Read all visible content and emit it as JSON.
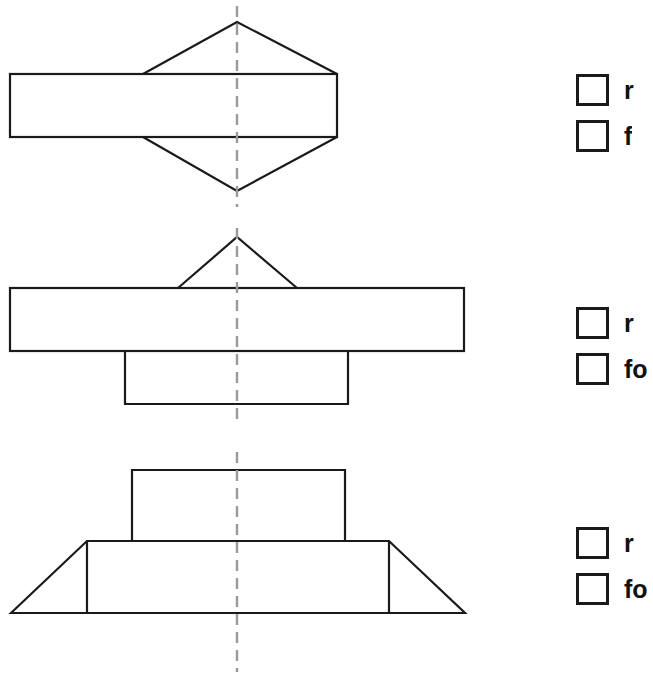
{
  "page": {
    "background_color": "#ffffff",
    "line_color": "#1a1a1a",
    "centerline_color": "#9a9a9a"
  },
  "figures": [
    {
      "id": "figure-1",
      "name": "hexagonal-prism-front-view",
      "description": "Horizontal rectangle with triangular peaks above and below meeting at the vertical centerline",
      "centerline_x": 237,
      "centerline_top": 6,
      "centerline_bottom": 207
    },
    {
      "id": "figure-2",
      "name": "stepped-block-with-roof-view",
      "description": "Wide horizontal rectangle with a small triangle on top and a narrower rectangle below",
      "centerline_x": 237,
      "centerline_top": 228,
      "centerline_bottom": 424
    },
    {
      "id": "figure-3",
      "name": "trapezoid-base-with-upper-block-view",
      "description": "Trapezoid base with internal vertical lines and an upper rectangle",
      "centerline_x": 237,
      "centerline_top": 452,
      "centerline_bottom": 672
    }
  ],
  "answer_groups": [
    {
      "name": "answer-group-1",
      "options": [
        {
          "name": "option-r",
          "label": "r",
          "checked": false
        },
        {
          "name": "option-f",
          "label": "f",
          "checked": false
        }
      ]
    },
    {
      "name": "answer-group-2",
      "options": [
        {
          "name": "option-r",
          "label": "r",
          "checked": false
        },
        {
          "name": "option-f",
          "label": "fo",
          "checked": false
        }
      ]
    },
    {
      "name": "answer-group-3",
      "options": [
        {
          "name": "option-r",
          "label": "r",
          "checked": false
        },
        {
          "name": "option-f",
          "label": "fo",
          "checked": false
        }
      ]
    }
  ]
}
